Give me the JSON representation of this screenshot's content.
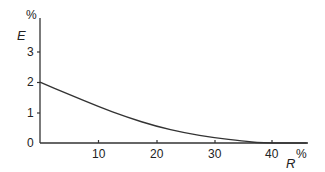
{
  "chart_data": {
    "type": "line",
    "title": "",
    "xlabel": "R",
    "xunit": "%",
    "ylabel": "E",
    "yunit": "%",
    "xlim": [
      0,
      46
    ],
    "ylim": [
      0,
      3.8
    ],
    "x_ticks": [
      10,
      20,
      30,
      40
    ],
    "y_ticks": [
      0,
      1,
      2,
      3
    ],
    "grid": false,
    "legend": null,
    "series": [
      {
        "name": "E vs R",
        "x": [
          0,
          5,
          10,
          15,
          20,
          25,
          30,
          35,
          38,
          46
        ],
        "y": [
          2.0,
          1.6,
          1.2,
          0.85,
          0.55,
          0.33,
          0.17,
          0.07,
          0.0,
          0.0
        ]
      }
    ]
  },
  "labels": {
    "y_unit": "%",
    "y_name": "E",
    "x_unit": "%",
    "x_name": "R",
    "y_tick_0": "0",
    "y_tick_1": "1",
    "y_tick_2": "2",
    "y_tick_3": "3",
    "x_tick_10": "10",
    "x_tick_20": "20",
    "x_tick_30": "30",
    "x_tick_40": "40"
  }
}
